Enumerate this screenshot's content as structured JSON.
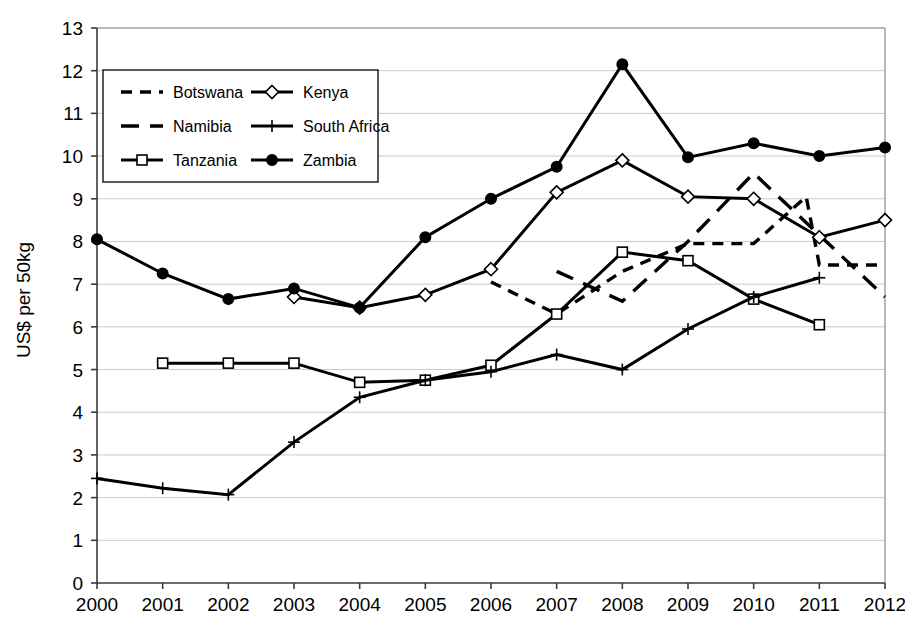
{
  "chart_data": {
    "type": "line",
    "title": "",
    "xlabel": "",
    "ylabel": "US$ per 50kg",
    "x": [
      2000,
      2001,
      2002,
      2003,
      2004,
      2005,
      2006,
      2007,
      2008,
      2009,
      2010,
      2011,
      2012
    ],
    "xtick_labels": [
      "2000",
      "2001",
      "2002",
      "2003",
      "2004",
      "2005",
      "2006",
      "2007",
      "2008",
      "2009",
      "2010",
      "2011",
      "2012"
    ],
    "ytick_labels": [
      "0",
      "1",
      "2",
      "3",
      "4",
      "5",
      "6",
      "7",
      "8",
      "9",
      "10",
      "11",
      "12",
      "13"
    ],
    "ylim": [
      0,
      13
    ],
    "xlim": [
      2000,
      2012
    ],
    "grid": "horizontal",
    "legend_position": "upper-left",
    "series": [
      {
        "name": "Botswana",
        "line_style": "dashed-short",
        "marker": "none",
        "x": [
          2006,
          2007,
          2008,
          2009,
          2010,
          2010.8,
          2011,
          2012
        ],
        "values": [
          7.05,
          6.3,
          7.3,
          7.95,
          7.95,
          9.05,
          7.45,
          7.45
        ]
      },
      {
        "name": "Namibia",
        "line_style": "dashed-long",
        "marker": "none",
        "x": [
          2007,
          2008,
          2009,
          2010,
          2011,
          2012
        ],
        "values": [
          7.3,
          6.6,
          8.0,
          9.6,
          8.15,
          6.7
        ]
      },
      {
        "name": "Tanzania",
        "line_style": "solid",
        "marker": "open-square",
        "x": [
          2001,
          2002,
          2003,
          2004,
          2005,
          2006,
          2007,
          2008,
          2009,
          2010,
          2011
        ],
        "values": [
          5.15,
          5.15,
          5.15,
          4.7,
          4.75,
          5.1,
          6.3,
          7.75,
          7.55,
          6.65,
          6.05
        ]
      },
      {
        "name": "Kenya",
        "line_style": "solid",
        "marker": "open-diamond",
        "x": [
          2003,
          2004,
          2005,
          2006,
          2007,
          2008,
          2009,
          2010,
          2011,
          2012
        ],
        "values": [
          6.7,
          6.45,
          6.75,
          7.35,
          9.15,
          9.9,
          9.05,
          9.0,
          8.1,
          8.5
        ]
      },
      {
        "name": "South Africa",
        "line_style": "solid",
        "marker": "plus",
        "x": [
          2000,
          2001,
          2002,
          2003,
          2004,
          2005,
          2006,
          2007,
          2008,
          2009,
          2010,
          2011
        ],
        "values": [
          2.45,
          2.22,
          2.07,
          3.3,
          4.35,
          4.75,
          4.95,
          5.35,
          5.0,
          5.95,
          6.7,
          7.15
        ]
      },
      {
        "name": "Zambia",
        "line_style": "solid",
        "marker": "filled-circle",
        "x": [
          2000,
          2001,
          2002,
          2003,
          2004,
          2005,
          2006,
          2007,
          2008,
          2009,
          2010,
          2011,
          2012
        ],
        "values": [
          8.05,
          7.25,
          6.65,
          6.9,
          6.45,
          8.1,
          9.0,
          9.75,
          12.15,
          9.97,
          10.3,
          10.0,
          10.2
        ]
      }
    ]
  },
  "legend": {
    "entries": [
      {
        "label": "Botswana",
        "style": "dashed-short",
        "marker": "none"
      },
      {
        "label": "Kenya",
        "style": "solid",
        "marker": "open-diamond"
      },
      {
        "label": "Namibia",
        "style": "dashed-long",
        "marker": "none"
      },
      {
        "label": "South Africa",
        "style": "solid",
        "marker": "plus"
      },
      {
        "label": "Tanzania",
        "style": "solid",
        "marker": "open-square"
      },
      {
        "label": "Zambia",
        "style": "solid",
        "marker": "filled-circle"
      }
    ]
  },
  "colors": {
    "ink": "#000000",
    "grid": "#c9c9c9",
    "axis": "#3a3a3a",
    "background": "#ffffff"
  }
}
